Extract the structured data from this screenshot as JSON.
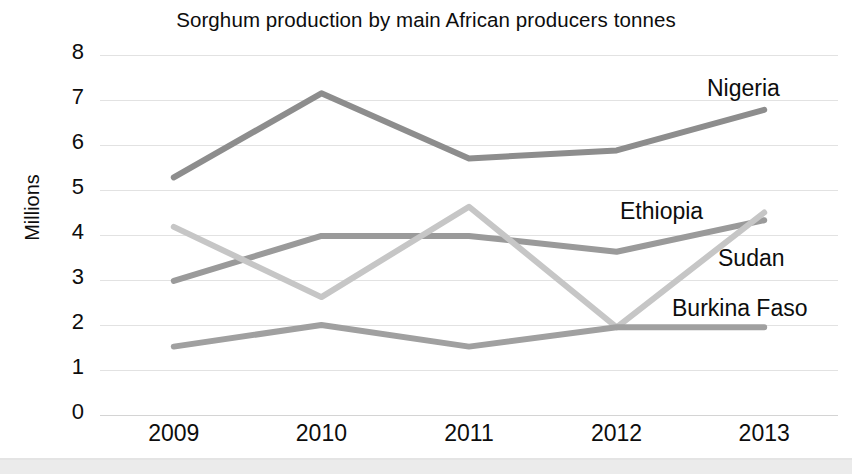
{
  "chart_data": {
    "type": "line",
    "title": "Sorghum production by main African producers tonnes",
    "xlabel": "",
    "ylabel": "Millions",
    "categories": [
      "2009",
      "2010",
      "2011",
      "2012",
      "2013"
    ],
    "ylim": [
      0,
      8
    ],
    "ytick_labels": [
      "8",
      "7",
      "6",
      "5",
      "4",
      "3",
      "2",
      "1",
      "0"
    ],
    "yticks": [
      8,
      7,
      6,
      5,
      4,
      3,
      2,
      1,
      0
    ],
    "grid": true,
    "legend_position": "inline-right",
    "series": [
      {
        "name": "Nigeria",
        "color": "#8d8d8d",
        "values": [
          5.28,
          7.15,
          5.7,
          5.88,
          6.78
        ]
      },
      {
        "name": "Ethiopia",
        "color": "#9a9a9a",
        "values": [
          2.98,
          3.98,
          3.98,
          3.63,
          4.33
        ]
      },
      {
        "name": "Sudan",
        "color": "#c6c6c6",
        "values": [
          4.18,
          2.62,
          4.63,
          1.95,
          4.5
        ]
      },
      {
        "name": "Burkina Faso",
        "color": "#a0a0a0",
        "values": [
          1.52,
          2.0,
          1.52,
          1.95,
          1.95
        ]
      }
    ],
    "annotations": [
      {
        "text": "Nigeria",
        "series": "Nigeria"
      },
      {
        "text": "Ethiopia",
        "series": "Ethiopia"
      },
      {
        "text": "Sudan",
        "series": "Sudan"
      },
      {
        "text": "Burkina Faso",
        "series": "Burkina Faso"
      }
    ]
  },
  "colors": {
    "background": "#ffffff",
    "text": "#0d0d0d",
    "gridline": "#e2e2e2"
  }
}
